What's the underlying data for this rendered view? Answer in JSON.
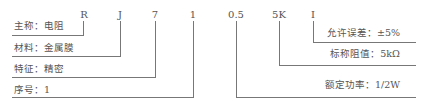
{
  "codes": [
    "R",
    "J",
    "7",
    "1",
    "0.5",
    "5K",
    "I"
  ],
  "left_labels": [
    {
      "key": "主称",
      "sep": "：",
      "value": "电阻"
    },
    {
      "key": "材料",
      "sep": "：",
      "value": "金属膜"
    },
    {
      "key": "特征",
      "sep": "：",
      "value": "精密"
    },
    {
      "key": "序号",
      "sep": "：",
      "value": "1"
    }
  ],
  "right_labels": [
    {
      "key": "允许误差",
      "sep": "：",
      "value": "±5%"
    },
    {
      "key": "标称阻值",
      "sep": "：",
      "value": "5kΩ"
    },
    {
      "key": "额定功率",
      "sep": "：",
      "value": "1/2W"
    }
  ],
  "display": {
    "l0": "主称：电阻",
    "l1": "材料：金属膜",
    "l2": "特征：精密",
    "l3": "序号：1",
    "r0": "允许误差：±5%",
    "r1": "标称阻值：5kΩ",
    "r2": "额定功率：1/2W"
  }
}
